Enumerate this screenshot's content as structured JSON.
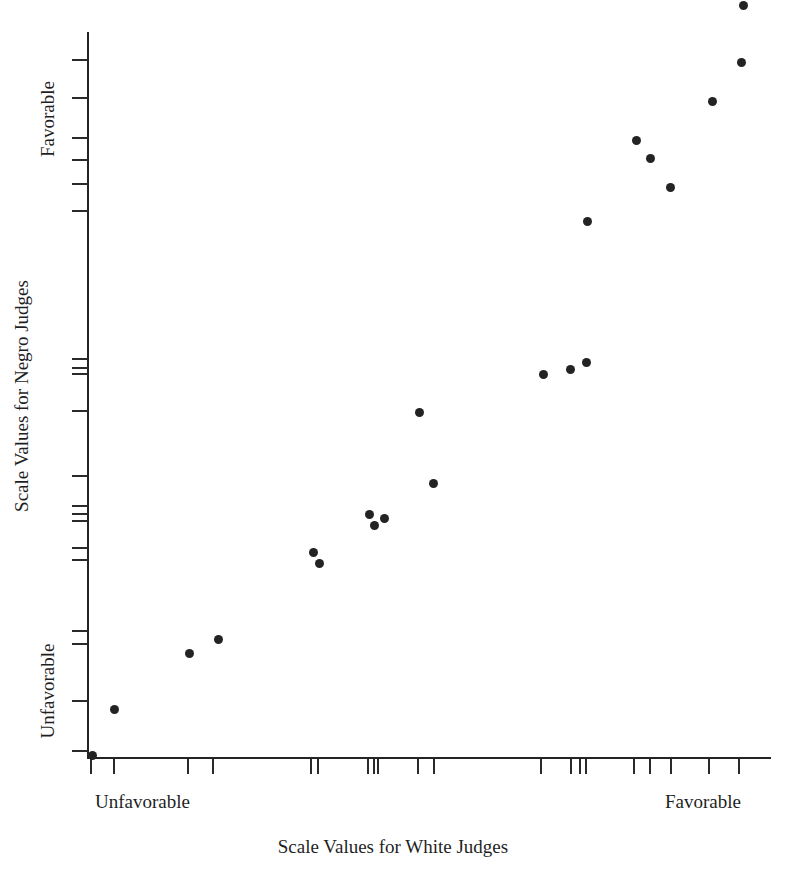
{
  "figure": {
    "background": "#ffffff",
    "ink_color": "#232323",
    "width": 786,
    "height": 873
  },
  "chart_data": {
    "type": "scatter",
    "title": "",
    "xlabel": "Scale Values for White Judges",
    "ylabel": "Scale Values for Negro Judges",
    "x_tick_labels": [
      "Unfavorable",
      "Favorable"
    ],
    "y_tick_labels": [
      "Unfavorable",
      "Favorable"
    ],
    "x_label_low": "Unfavorable",
    "x_label_high": "Favorable",
    "y_label_low": "Unfavorable",
    "y_label_high": "Favorable",
    "grid": false,
    "legend": null,
    "xlim": [
      0,
      11
    ],
    "ylim": [
      0,
      11
    ],
    "marker": "filled-circle",
    "marker_color": "#232323",
    "n_points": 21,
    "points": [
      {
        "x": 0.02,
        "y": 0.05,
        "px": 92,
        "py": 755
      },
      {
        "x": 0.4,
        "y": 0.73,
        "px": 114,
        "py": 709
      },
      {
        "x": 1.55,
        "y": 1.58,
        "px": 189,
        "py": 653
      },
      {
        "x": 2.0,
        "y": 1.8,
        "px": 218,
        "py": 639
      },
      {
        "x": 3.45,
        "y": 3.12,
        "px": 313,
        "py": 552
      },
      {
        "x": 3.55,
        "y": 2.95,
        "px": 319,
        "py": 563
      },
      {
        "x": 4.3,
        "y": 3.55,
        "px": 369,
        "py": 514
      },
      {
        "x": 4.38,
        "y": 3.44,
        "px": 374,
        "py": 525
      },
      {
        "x": 4.55,
        "y": 3.5,
        "px": 384,
        "py": 518
      },
      {
        "x": 5.1,
        "y": 4.62,
        "px": 419,
        "py": 412
      },
      {
        "x": 5.3,
        "y": 4.18,
        "px": 433,
        "py": 483
      },
      {
        "x": 6.95,
        "y": 6.0,
        "px": 543,
        "py": 374
      },
      {
        "x": 7.35,
        "y": 6.08,
        "px": 570,
        "py": 369
      },
      {
        "x": 7.6,
        "y": 6.18,
        "px": 586,
        "py": 362
      },
      {
        "x": 7.62,
        "y": 8.3,
        "px": 587,
        "py": 221
      },
      {
        "x": 8.35,
        "y": 9.5,
        "px": 636,
        "py": 140
      },
      {
        "x": 8.58,
        "y": 9.22,
        "px": 650,
        "py": 158
      },
      {
        "x": 8.9,
        "y": 8.8,
        "px": 670,
        "py": 187
      },
      {
        "x": 9.52,
        "y": 9.95,
        "px": 712,
        "py": 101
      },
      {
        "x": 9.98,
        "y": 10.52,
        "px": 741,
        "py": 62
      },
      {
        "x": 10.05,
        "y": 11.1,
        "px": 743,
        "py": 5
      }
    ],
    "x_ticks_px": [
      90,
      113,
      187,
      212,
      310,
      317,
      367,
      373,
      377,
      417,
      433,
      540,
      570,
      579,
      585,
      633,
      649,
      670,
      708,
      738
    ],
    "y_ticks_px": [
      59,
      97,
      137,
      159,
      183,
      210,
      358,
      367,
      373,
      410,
      475,
      505,
      513,
      520,
      547,
      559,
      630,
      643,
      700,
      750
    ],
    "axis": {
      "x_origin_px": 88,
      "x_end_px": 770,
      "y_top_px": 32,
      "y_bottom_px": 758
    }
  }
}
